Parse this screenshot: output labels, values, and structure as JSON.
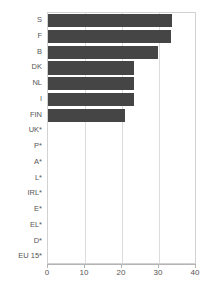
{
  "chart_data": {
    "type": "bar",
    "orientation": "horizontal",
    "title": "",
    "subtitle": "",
    "xlabel": "",
    "ylabel": "",
    "xlim": [
      0,
      40
    ],
    "xticks": [
      0,
      10,
      20,
      30,
      40
    ],
    "xtick_labels": [
      "0",
      "10",
      "20",
      "30",
      "40"
    ],
    "grid": true,
    "grid_axis": "x",
    "legend": false,
    "legend_position": "none",
    "bar_color": "#454545",
    "frame_color": "#d2d2d2",
    "gridline_color": "#dcdcdc",
    "axis_color": "#b4b4b4",
    "label_color": "#555555",
    "categories": [
      "S",
      "F",
      "B",
      "DK",
      "NL",
      "I",
      "FIN",
      "UK*",
      "P*",
      "A*",
      "L*",
      "IRL*",
      "E*",
      "EL*",
      "D*",
      "EU 15*"
    ],
    "values": [
      33.5,
      33.3,
      29.7,
      23.3,
      23.2,
      23.2,
      20.8,
      0,
      0,
      0,
      0,
      0,
      0,
      0,
      0,
      0
    ]
  }
}
